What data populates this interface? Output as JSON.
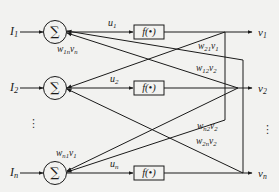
{
  "diagram": {
    "type": "hopfield-network",
    "colors": {
      "background": "#f2f2f0",
      "stroke": "#1a1a1a"
    },
    "neurons": [
      {
        "input": {
          "base": "I",
          "sub": "1"
        },
        "sum_symbol": "∑",
        "internal": {
          "base": "u",
          "sub": "1"
        },
        "activation": "f(•)",
        "output": {
          "base": "v",
          "sub": "1"
        }
      },
      {
        "input": {
          "base": "I",
          "sub": "2"
        },
        "sum_symbol": "∑",
        "internal": {
          "base": "u",
          "sub": "2"
        },
        "activation": "f(•)",
        "output": {
          "base": "v",
          "sub": "2"
        }
      },
      {
        "input": {
          "base": "I",
          "sub": "n"
        },
        "sum_symbol": "∑",
        "internal": {
          "base": "u",
          "sub": "n"
        },
        "activation": "f(•)",
        "output": {
          "base": "v",
          "sub": "n"
        }
      }
    ],
    "weights": [
      {
        "w": "w",
        "w_sub": "1n",
        "v": "v",
        "v_sub": "n"
      },
      {
        "w": "w",
        "w_sub": "21",
        "v": "v",
        "v_sub": "1"
      },
      {
        "w": "w",
        "w_sub": "12",
        "v": "v",
        "v_sub": "2"
      },
      {
        "w": "w",
        "w_sub": "n2",
        "v": "v",
        "v_sub": "2"
      },
      {
        "w": "w",
        "w_sub": "2n",
        "v": "v",
        "v_sub": "2"
      },
      {
        "w": "w",
        "w_sub": "n1",
        "v": "v",
        "v_sub": "1"
      }
    ],
    "ellipsis": "⋮"
  }
}
